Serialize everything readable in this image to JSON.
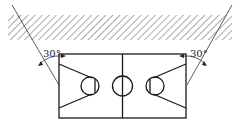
{
  "diagram": {
    "colors": {
      "line": "#1a1a1a",
      "hatch": "#555555",
      "background": "#ffffff"
    },
    "labels": {
      "left_angle": "30°",
      "right_angle": "30°"
    },
    "elements": [
      "hatched-boundary-band",
      "left-sight-line",
      "right-sight-line",
      "court-outline",
      "center-line",
      "center-circle",
      "left-key",
      "right-key"
    ]
  }
}
